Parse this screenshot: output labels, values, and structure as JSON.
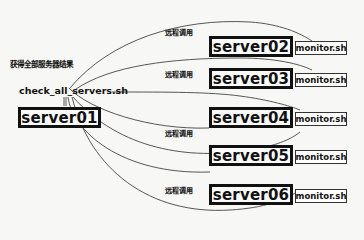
{
  "diagram": {
    "type": "remote-call-topology",
    "origin": {
      "server": "server01",
      "script": "check_all_servers.sh",
      "result_label": "获得全部服务器结果"
    },
    "call_label": "远程调用",
    "targets": [
      {
        "server": "server02",
        "script": "monitor.sh",
        "call_label": "远程调用"
      },
      {
        "server": "server03",
        "script": "monitor.sh",
        "call_label": "远程调用"
      },
      {
        "server": "server04",
        "script": "monitor.sh",
        "call_label": ""
      },
      {
        "server": "server05",
        "script": "monitor.sh",
        "call_label": "远程调用"
      },
      {
        "server": "server06",
        "script": "monitor.sh",
        "call_label": "远程调用"
      }
    ],
    "labels": {
      "call_1": "远程调用",
      "call_2": "远程调用",
      "call_3": "远程调用",
      "call_4": "远程调用"
    },
    "colors": {
      "line": "#333333",
      "box_border": "#111111",
      "background": "#f7f7f5"
    }
  }
}
